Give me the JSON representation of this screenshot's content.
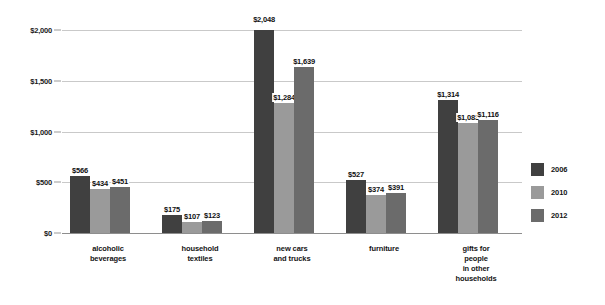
{
  "chart_data": {
    "type": "bar",
    "title": "",
    "subtitle": "",
    "xlabel": "",
    "ylabel": "",
    "ylim": [
      0,
      2000
    ],
    "ytick_values": [
      0,
      500,
      1000,
      1500,
      2000
    ],
    "ytick_labels": [
      "$0",
      "$500",
      "$1,000",
      "$1,500",
      "$2,000"
    ],
    "grid": true,
    "legend_position": "right",
    "categories": [
      "alcoholic\nbeverages",
      "household\ntextiles",
      "new cars\nand trucks",
      "furniture",
      "gifts for\npeople\nin other\nhouseholds"
    ],
    "series": [
      {
        "name": "2006",
        "color": "#404040",
        "values": [
          566,
          175,
          2048,
          527,
          1314
        ],
        "value_labels": [
          "$566",
          "$175",
          "$2,048",
          "$527",
          "$1,314"
        ]
      },
      {
        "name": "2010",
        "color": "#9a9a9a",
        "values": [
          434,
          107,
          1284,
          374,
          1083
        ],
        "value_labels": [
          "$434",
          "$107",
          "$1,284",
          "$374",
          "$1,083"
        ]
      },
      {
        "name": "2012",
        "color": "#6b6b6b",
        "values": [
          451,
          123,
          1639,
          391,
          1116
        ],
        "value_labels": [
          "$451",
          "$123",
          "$1,639",
          "$391",
          "$1,116"
        ]
      }
    ]
  },
  "legend": {
    "items": [
      {
        "label": "2006",
        "color": "#404040"
      },
      {
        "label": "2010",
        "color": "#9a9a9a"
      },
      {
        "label": "2012",
        "color": "#6b6b6b"
      }
    ]
  },
  "axis": {
    "y_ticks": [
      {
        "label": "$2,000",
        "value": 2000
      },
      {
        "label": "$1,500",
        "value": 1500
      },
      {
        "label": "$1,000",
        "value": 1000
      },
      {
        "label": "$500",
        "value": 500
      },
      {
        "label": "$0",
        "value": 0
      }
    ]
  }
}
